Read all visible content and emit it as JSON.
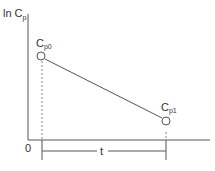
{
  "diagram": {
    "y_axis_label": "ln C",
    "y_axis_sub": "p",
    "origin_label": "0",
    "point_start": {
      "label": "C",
      "sub": "p0"
    },
    "point_end": {
      "label": "C",
      "sub": "p1"
    },
    "interval_label": "t",
    "colors": {
      "line": "#555555",
      "text": "#333333",
      "dashed": "#888888"
    }
  }
}
